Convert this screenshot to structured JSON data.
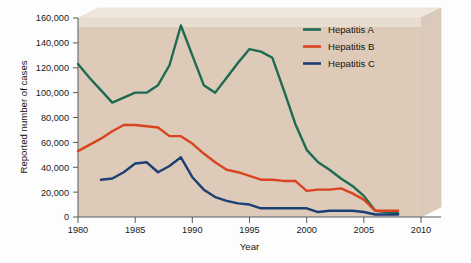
{
  "chart_data": {
    "type": "line",
    "title": "",
    "xlabel": "Year",
    "ylabel": "Reported number of cases",
    "xlim": [
      1980,
      2010
    ],
    "ylim": [
      0,
      160000
    ],
    "xticks": [
      "1980",
      "1985",
      "1990",
      "1995",
      "2000",
      "2005",
      "2010"
    ],
    "xtick_values": [
      1980,
      1985,
      1990,
      1995,
      2000,
      2005,
      2010
    ],
    "yticks": [
      "0",
      "20,000",
      "40,000",
      "60,000",
      "80,000",
      "100,000",
      "120,000",
      "140,000",
      "160,000"
    ],
    "ytick_values": [
      0,
      20000,
      40000,
      60000,
      80000,
      100000,
      120000,
      140000,
      160000
    ],
    "grid": false,
    "legend_position": "top-right",
    "series": [
      {
        "name": "Hepatitis A",
        "color": "#1d6b52",
        "x": [
          1980,
          1981,
          1982,
          1983,
          1984,
          1985,
          1986,
          1987,
          1988,
          1989,
          1990,
          1991,
          1992,
          1993,
          1994,
          1995,
          1996,
          1997,
          1998,
          1999,
          2000,
          2001,
          2002,
          2003,
          2004,
          2005,
          2006,
          2007,
          2008
        ],
        "values": [
          123000,
          112000,
          102000,
          92000,
          96000,
          100000,
          100000,
          106000,
          122000,
          154000,
          130000,
          106000,
          100000,
          112000,
          124000,
          135000,
          133000,
          128000,
          102000,
          75000,
          54000,
          44000,
          38000,
          31000,
          25000,
          17000,
          5000,
          4000,
          3000
        ]
      },
      {
        "name": "Hepatitis B",
        "color": "#d9441f",
        "x": [
          1980,
          1981,
          1982,
          1983,
          1984,
          1985,
          1986,
          1987,
          1988,
          1989,
          1990,
          1991,
          1992,
          1993,
          1994,
          1995,
          1996,
          1997,
          1998,
          1999,
          2000,
          2001,
          2002,
          2003,
          2004,
          2005,
          2006,
          2007,
          2008
        ],
        "values": [
          53000,
          58000,
          63000,
          69000,
          74000,
          74000,
          73000,
          72000,
          65000,
          65000,
          59000,
          51000,
          44000,
          38000,
          36000,
          33000,
          30000,
          30000,
          29000,
          29000,
          21000,
          22000,
          22000,
          23000,
          19000,
          14000,
          5000,
          5000,
          5000
        ]
      },
      {
        "name": "Hepatitis C",
        "color": "#1c3f74",
        "x": [
          1982,
          1983,
          1984,
          1985,
          1986,
          1987,
          1988,
          1989,
          1990,
          1991,
          1992,
          1993,
          1994,
          1995,
          1996,
          1997,
          1998,
          1999,
          2000,
          2001,
          2002,
          2003,
          2004,
          2005,
          2006,
          2007,
          2008
        ],
        "values": [
          30000,
          31000,
          36000,
          43000,
          44000,
          36000,
          41000,
          48000,
          32000,
          22000,
          16000,
          13000,
          11000,
          10000,
          7000,
          7000,
          7000,
          7000,
          7000,
          4000,
          5000,
          5000,
          5000,
          4000,
          2000,
          2000,
          2000
        ]
      }
    ],
    "legend": [
      {
        "label": "Hepatitis A",
        "color": "#1d6b52"
      },
      {
        "label": "Hepatitis B",
        "color": "#d9441f"
      },
      {
        "label": "Hepatitis C",
        "color": "#1c3f74"
      }
    ],
    "colors": {
      "plot_face": "#ddcab8",
      "plot_face_light": "#f3e9de",
      "slab_side": "#d7c8ba",
      "slab_top": "#efe6dc",
      "axis": "#5a5a5a",
      "text": "#141414"
    }
  }
}
